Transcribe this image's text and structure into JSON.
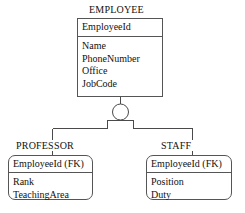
{
  "diagram": {
    "type": "er-supertype-subtype",
    "notation": "circle-with-single-bar",
    "background_color": "#ffffff",
    "line_color": "#4a4a4a",
    "text_color": "#111111"
  },
  "supertype": {
    "name": "EMPLOYEE",
    "primary_key": "EmployeeId",
    "attributes": [
      "Name",
      "PhoneNumber",
      "Office",
      "JobCode"
    ]
  },
  "discriminator": {
    "symbol_name": "subtype-circle",
    "bar_count": 1
  },
  "subtypes": [
    {
      "name": "PROFESSOR",
      "primary_key": "EmployeeId (FK)",
      "attributes": [
        "Rank",
        "TeachingArea"
      ]
    },
    {
      "name": "STAFF",
      "primary_key": "EmployeeId (FK)",
      "attributes": [
        "Position",
        "Duty"
      ]
    }
  ]
}
